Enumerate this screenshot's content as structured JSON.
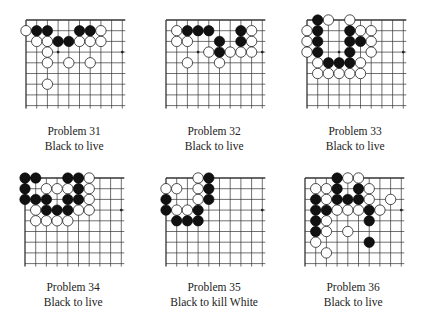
{
  "page": {
    "grid_spacing": 10.7,
    "stone_radius": 5.2,
    "colors": {
      "black": "#111111",
      "white": "#ffffff",
      "line": "#333333"
    }
  },
  "problems": [
    {
      "title": "Problem 31",
      "task": "Black to live",
      "origin": [
        26,
        20
      ],
      "cols": 9,
      "rows": 8,
      "star_points": [
        [
          3,
          3
        ],
        [
          9,
          3
        ]
      ],
      "black": [
        [
          1,
          1
        ],
        [
          2,
          1
        ],
        [
          5,
          1
        ],
        [
          6,
          1
        ],
        [
          3,
          2
        ],
        [
          4,
          2
        ]
      ],
      "white": [
        [
          0,
          1
        ],
        [
          7,
          1
        ],
        [
          1,
          2
        ],
        [
          2,
          2
        ],
        [
          5,
          2
        ],
        [
          6,
          2
        ],
        [
          7,
          2
        ],
        [
          2,
          3
        ],
        [
          2,
          4
        ],
        [
          4,
          4
        ],
        [
          6,
          4
        ],
        [
          2,
          6
        ]
      ]
    },
    {
      "title": "Problem 32",
      "task": "Black to live",
      "origin": [
        166,
        20
      ],
      "cols": 9,
      "rows": 8,
      "star_points": [
        [
          3,
          3
        ],
        [
          9,
          3
        ]
      ],
      "black": [
        [
          2,
          1
        ],
        [
          3,
          1
        ],
        [
          4,
          1
        ],
        [
          7,
          1
        ],
        [
          5,
          2
        ],
        [
          7,
          2
        ],
        [
          5,
          3
        ]
      ],
      "white": [
        [
          1,
          1
        ],
        [
          8,
          1
        ],
        [
          1,
          2
        ],
        [
          2,
          2
        ],
        [
          8,
          2
        ],
        [
          4,
          3
        ],
        [
          6,
          3
        ],
        [
          7,
          3
        ],
        [
          8,
          3
        ],
        [
          2,
          4
        ],
        [
          5,
          4
        ]
      ]
    },
    {
      "title": "Problem 33",
      "task": "Black to live",
      "origin": [
        307,
        20
      ],
      "cols": 9,
      "rows": 8,
      "star_points": [
        [
          3,
          3
        ],
        [
          9,
          3
        ]
      ],
      "black": [
        [
          1,
          0
        ],
        [
          1,
          1
        ],
        [
          4,
          1
        ],
        [
          1,
          2
        ],
        [
          4,
          2
        ],
        [
          5,
          2
        ],
        [
          1,
          3
        ],
        [
          4,
          3
        ],
        [
          2,
          4
        ],
        [
          3,
          4
        ],
        [
          4,
          4
        ]
      ],
      "white": [
        [
          2,
          0
        ],
        [
          4,
          0
        ],
        [
          0,
          1
        ],
        [
          5,
          1
        ],
        [
          6,
          1
        ],
        [
          0,
          2
        ],
        [
          6,
          2
        ],
        [
          0,
          3
        ],
        [
          6,
          3
        ],
        [
          1,
          4
        ],
        [
          5,
          4
        ],
        [
          1,
          5
        ],
        [
          2,
          5
        ],
        [
          3,
          5
        ],
        [
          4,
          5
        ],
        [
          5,
          5
        ]
      ]
    },
    {
      "title": "Problem 34",
      "task": "Black to live",
      "origin": [
        25,
        178
      ],
      "cols": 9,
      "rows": 8,
      "star_points": [
        [
          3,
          3
        ],
        [
          9,
          3
        ]
      ],
      "black": [
        [
          0,
          0
        ],
        [
          1,
          0
        ],
        [
          4,
          0
        ],
        [
          5,
          0
        ],
        [
          0,
          1
        ],
        [
          5,
          1
        ],
        [
          0,
          2
        ],
        [
          1,
          2
        ],
        [
          2,
          2
        ],
        [
          4,
          2
        ],
        [
          5,
          2
        ],
        [
          2,
          3
        ],
        [
          3,
          3
        ],
        [
          4,
          3
        ]
      ],
      "white": [
        [
          6,
          0
        ],
        [
          2,
          1
        ],
        [
          3,
          1
        ],
        [
          4,
          1
        ],
        [
          6,
          1
        ],
        [
          6,
          2
        ],
        [
          1,
          3
        ],
        [
          5,
          3
        ],
        [
          6,
          3
        ],
        [
          1,
          4
        ],
        [
          2,
          4
        ],
        [
          3,
          4
        ],
        [
          4,
          4
        ]
      ]
    },
    {
      "title": "Problem 35",
      "task": "Black to kill White",
      "origin": [
        166,
        178
      ],
      "cols": 9,
      "rows": 8,
      "star_points": [
        [
          3,
          3
        ],
        [
          9,
          3
        ]
      ],
      "black": [
        [
          4,
          0
        ],
        [
          4,
          1
        ],
        [
          0,
          2
        ],
        [
          4,
          2
        ],
        [
          0,
          3
        ],
        [
          3,
          3
        ],
        [
          1,
          4
        ],
        [
          2,
          4
        ],
        [
          3,
          4
        ]
      ],
      "white": [
        [
          3,
          0
        ],
        [
          0,
          1
        ],
        [
          1,
          1
        ],
        [
          3,
          1
        ],
        [
          3,
          2
        ],
        [
          1,
          3
        ],
        [
          2,
          3
        ]
      ]
    },
    {
      "title": "Problem 36",
      "task": "Black to live",
      "origin": [
        305,
        178
      ],
      "cols": 9,
      "rows": 8,
      "star_points": [
        [
          3,
          3
        ],
        [
          9,
          3
        ]
      ],
      "black": [
        [
          3,
          0
        ],
        [
          3,
          1
        ],
        [
          5,
          1
        ],
        [
          1,
          2
        ],
        [
          3,
          2
        ],
        [
          4,
          2
        ],
        [
          5,
          2
        ],
        [
          1,
          3
        ],
        [
          2,
          3
        ],
        [
          6,
          3
        ],
        [
          1,
          4
        ],
        [
          6,
          4
        ],
        [
          1,
          5
        ],
        [
          6,
          6
        ]
      ],
      "white": [
        [
          4,
          0
        ],
        [
          5,
          0
        ],
        [
          1,
          1
        ],
        [
          2,
          1
        ],
        [
          6,
          1
        ],
        [
          2,
          2
        ],
        [
          6,
          2
        ],
        [
          8,
          2
        ],
        [
          3,
          3
        ],
        [
          4,
          3
        ],
        [
          5,
          3
        ],
        [
          7,
          3
        ],
        [
          2,
          4
        ],
        [
          2,
          5
        ],
        [
          4,
          5
        ],
        [
          1,
          6
        ],
        [
          2,
          7
        ]
      ]
    }
  ]
}
